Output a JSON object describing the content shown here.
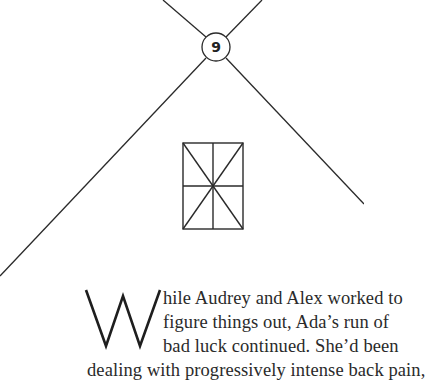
{
  "chapter": {
    "number": "9",
    "ornament": "window-icon"
  },
  "body": {
    "drop_cap": "W",
    "lines": [
      "hile Audrey and Alex worked to",
      "figure things out, Ada’s run of",
      "bad luck continued. She’d been",
      "dealing with progressively intense back pain,"
    ]
  },
  "colors": {
    "ink": "#2a2a2a",
    "background": "#ffffff"
  }
}
